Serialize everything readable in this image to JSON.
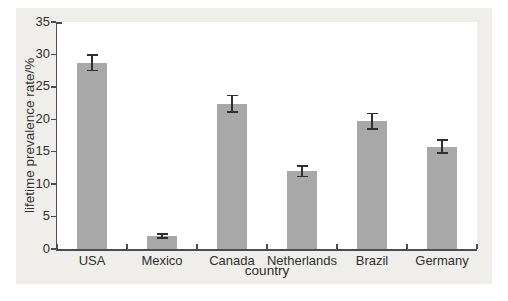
{
  "figure": {
    "page_background": "#ffffff",
    "mat_background": "#f0eeeb",
    "plot_background": "#ffffff",
    "axis_color": "#4d4d4d",
    "bar_color": "#a8a8a8",
    "error_bar_color": "#2f2f2f",
    "text_color": "#2e2e2e"
  },
  "chart_data": {
    "type": "bar",
    "title": "",
    "xlabel": "country",
    "ylabel": "lifetime prevalence rate/%",
    "categories": [
      "USA",
      "Mexico",
      "Canada",
      "Netherlands",
      "Brazil",
      "Germany"
    ],
    "values": [
      28.7,
      2.0,
      22.4,
      12.0,
      19.7,
      15.8
    ],
    "error_bars": [
      1.2,
      0.3,
      1.3,
      0.8,
      1.2,
      1.0
    ],
    "ylim": [
      0,
      35
    ],
    "yticks": [
      0,
      5,
      10,
      15,
      20,
      25,
      30,
      35
    ],
    "grid": false,
    "legend": null,
    "error_bars_shown": true
  }
}
